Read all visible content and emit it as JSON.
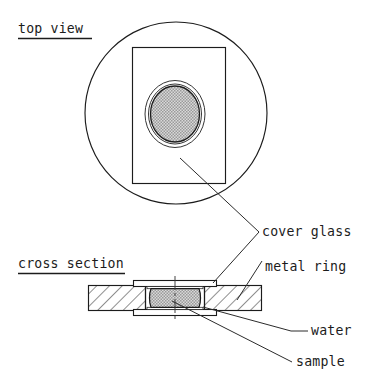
{
  "figure": {
    "title_top_view": "top view",
    "title_cross_section": "cross section",
    "labels": {
      "cover_glass": "cover glass",
      "metal_ring": "metal ring",
      "water": "water",
      "sample": "sample"
    },
    "colors": {
      "line": "#1c1c1c",
      "sample_fill": "#b9b9b9",
      "background": "#ffffff",
      "hatch": "#2a2a2a"
    },
    "parts": [
      {
        "name": "metal ring",
        "top_view": "outer circle",
        "cross_section": "hatched slab, left and right"
      },
      {
        "name": "cover glass",
        "top_view": "rectangle",
        "cross_section": "thin strips above and below sample"
      },
      {
        "name": "water",
        "top_view": "thin annulus around sample",
        "cross_section": "thin gap at sample edges"
      },
      {
        "name": "sample",
        "top_view": "stippled grey disc",
        "cross_section": "stippled grey barrel in centre"
      }
    ]
  }
}
